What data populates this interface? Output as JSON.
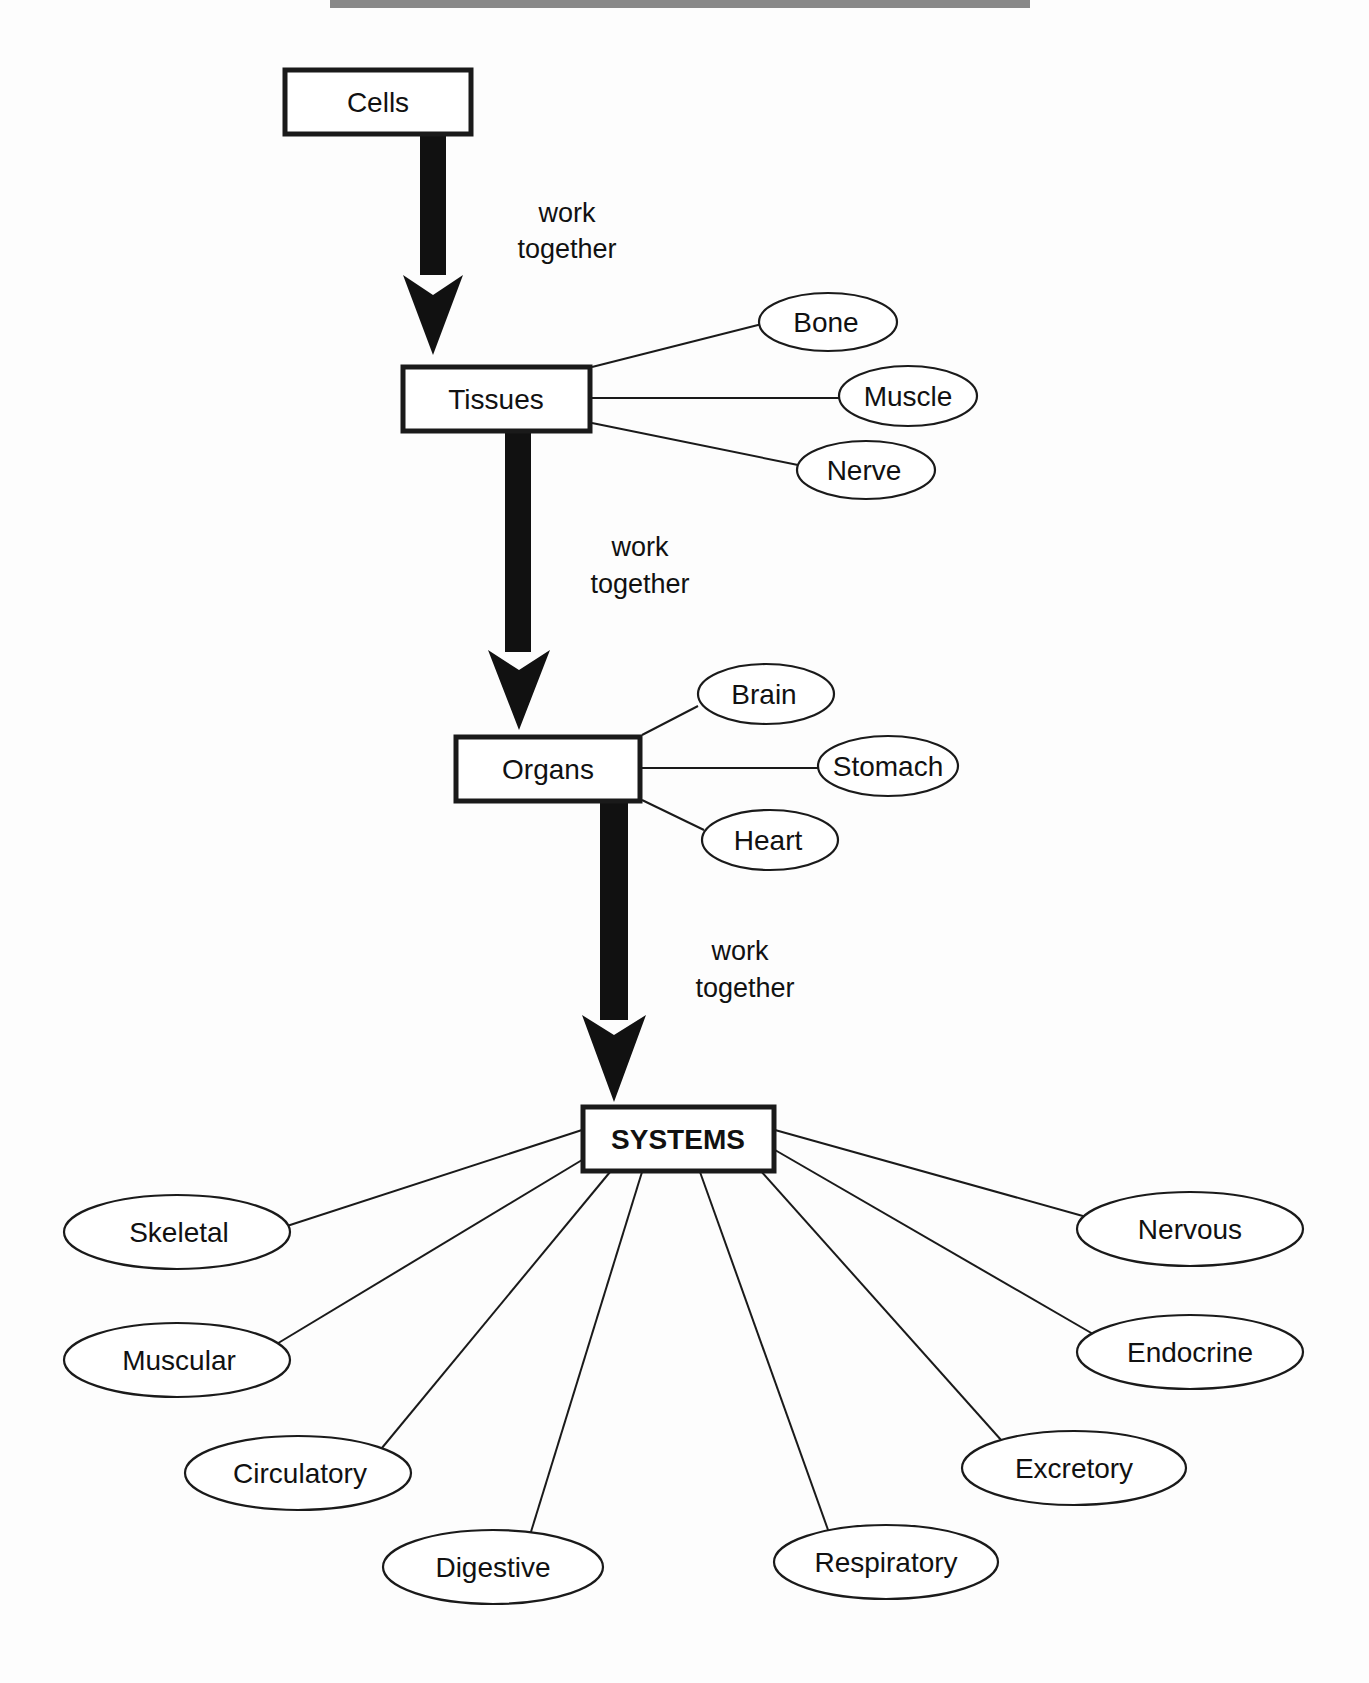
{
  "diagram": {
    "type": "hierarchy",
    "levels": [
      {
        "id": "cells",
        "label": "Cells"
      },
      {
        "id": "tissues",
        "label": "Tissues"
      },
      {
        "id": "organs",
        "label": "Organs"
      },
      {
        "id": "systems",
        "label": "SYSTEMS"
      }
    ],
    "arrows": [
      {
        "from": "cells",
        "to": "tissues",
        "label_line1": "work",
        "label_line2": "together"
      },
      {
        "from": "tissues",
        "to": "organs",
        "label_line1": "work",
        "label_line2": "together"
      },
      {
        "from": "organs",
        "to": "systems",
        "label_line1": "work",
        "label_line2": "together"
      }
    ],
    "tissue_examples": [
      "Bone",
      "Muscle",
      "Nerve"
    ],
    "organ_examples": [
      "Brain",
      "Stomach",
      "Heart"
    ],
    "system_examples": [
      "Skeletal",
      "Muscular",
      "Circulatory",
      "Digestive",
      "Respiratory",
      "Excretory",
      "Endocrine",
      "Nervous"
    ]
  }
}
